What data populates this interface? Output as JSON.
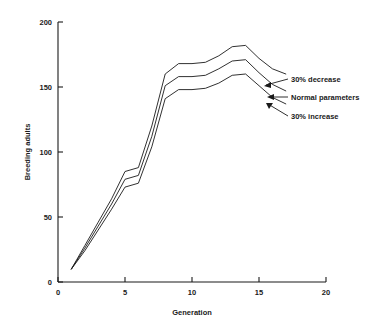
{
  "chart_data": {
    "type": "line",
    "title": "",
    "xlabel": "Generation",
    "ylabel": "Breeding adults",
    "xlim": [
      0,
      20
    ],
    "ylim": [
      0,
      200
    ],
    "xticks": [
      0,
      5,
      10,
      15,
      20
    ],
    "yticks": [
      0,
      50,
      100,
      150,
      200
    ],
    "grid": false,
    "legend_position": "inline-annotations",
    "x": [
      1,
      2,
      3,
      4,
      5,
      6,
      7,
      8,
      9,
      10,
      11,
      12,
      13,
      14,
      15,
      16,
      17
    ],
    "series": [
      {
        "name": "30% decrease",
        "values": [
          10,
          28,
          46,
          64,
          85,
          88,
          120,
          160,
          168,
          168,
          169,
          174,
          181,
          182,
          172,
          164,
          160
        ]
      },
      {
        "name": "Normal parameters",
        "values": [
          10,
          26,
          43,
          60,
          79,
          82,
          112,
          151,
          158,
          158,
          159,
          164,
          170,
          171,
          161,
          152,
          147
        ]
      },
      {
        "name": "30% increase",
        "values": [
          10,
          24,
          40,
          56,
          73,
          76,
          104,
          141,
          148,
          148,
          149,
          153,
          159,
          160,
          151,
          142,
          137
        ]
      }
    ],
    "annotations": [
      {
        "label": "30% decrease",
        "series": "30% decrease"
      },
      {
        "label": "Normal parameters",
        "series": "Normal parameters"
      },
      {
        "label": "30% increase",
        "series": "30% increase"
      }
    ]
  },
  "axes": {
    "y_title": "Breeding adults",
    "x_title": "Generation",
    "y_tick_labels": [
      "0",
      "50",
      "100",
      "150",
      "200"
    ],
    "x_tick_labels": [
      "0",
      "5",
      "10",
      "15",
      "20"
    ]
  },
  "colors": {
    "ink": "#1a1a1a",
    "background": "#ffffff"
  }
}
